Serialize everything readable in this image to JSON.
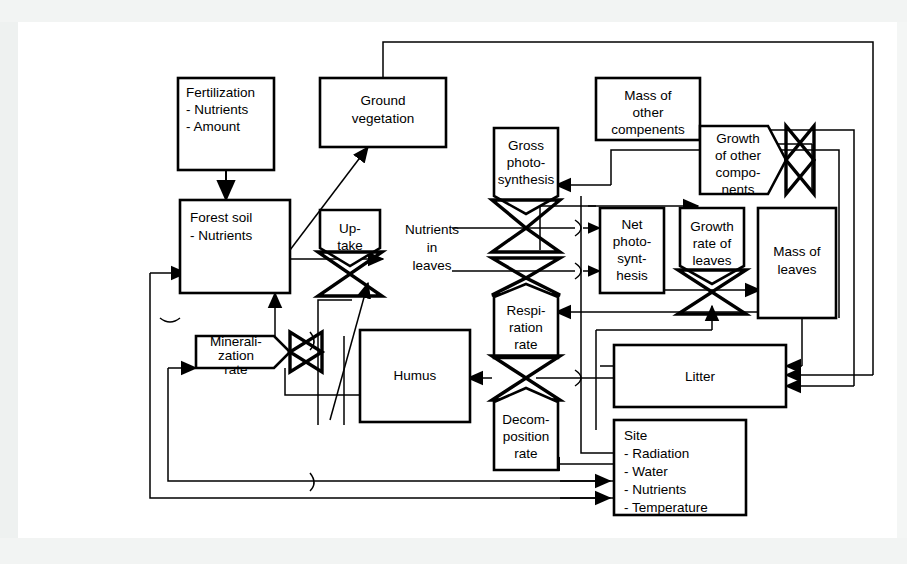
{
  "figure": {
    "kind": "system-dynamics-stock-and-flow-diagram",
    "colors": {
      "ink": "#000000",
      "paper": "#ffffff",
      "scan_edge": "#f2f4f3"
    }
  },
  "nodes": {
    "fertilization": {
      "lines": [
        "Fertilization",
        "- Nutrients",
        "- Amount"
      ],
      "shape": "stock-box",
      "align": "left"
    },
    "ground_vegetation": {
      "lines": [
        "Ground",
        "vegetation"
      ],
      "shape": "stock-box",
      "align": "center"
    },
    "forest_soil": {
      "lines": [
        "Forest soil",
        "- Nutrients"
      ],
      "shape": "stock-box",
      "align": "left"
    },
    "mineralization_rate": {
      "lines": [
        "Minerali-",
        "zation",
        "rate"
      ],
      "shape": "rate-valve-horizontal",
      "align": "center"
    },
    "humus": {
      "lines": [
        "Humus"
      ],
      "shape": "stock-box",
      "align": "center"
    },
    "uptake": {
      "lines": [
        "Up-",
        "take"
      ],
      "shape": "rate-valve-vertical",
      "align": "center"
    },
    "nutrients_in_leaves": {
      "lines": [
        "Nutrients",
        "in",
        "leaves"
      ],
      "shape": "free-label",
      "align": "center"
    },
    "gross_photosynthesis": {
      "lines": [
        "Gross",
        "photo-",
        "synthesis"
      ],
      "shape": "rate-valve-vertical",
      "align": "center"
    },
    "respiration_rate": {
      "lines": [
        "Respi-",
        "ration",
        "rate"
      ],
      "shape": "rate-valve-vertical",
      "align": "center"
    },
    "decomposition_rate": {
      "lines": [
        "Decom-",
        "position",
        "rate"
      ],
      "shape": "rate-valve-vertical",
      "align": "center"
    },
    "net_photosynthesis": {
      "lines": [
        "Net",
        "photo-",
        "synt-",
        "hesis"
      ],
      "shape": "stock-box",
      "align": "center"
    },
    "growth_rate_of_leaves": {
      "lines": [
        "Growth",
        "rate of",
        "leaves"
      ],
      "shape": "rate-valve-vertical",
      "align": "center"
    },
    "mass_of_leaves": {
      "lines": [
        "Mass of",
        "leaves"
      ],
      "shape": "stock-box",
      "align": "center"
    },
    "mass_of_other_compenents": {
      "lines": [
        "Mass of",
        "other",
        "compenents"
      ],
      "shape": "stock-box",
      "align": "center"
    },
    "growth_of_other_components": {
      "lines": [
        "Growth",
        "of other",
        "compo-",
        "nents"
      ],
      "shape": "rate-valve-horizontal",
      "align": "center"
    },
    "litter": {
      "lines": [
        "Litter"
      ],
      "shape": "stock-box",
      "align": "center"
    },
    "site": {
      "lines": [
        "Site",
        "- Radiation",
        "- Water",
        "- Nutrients",
        "- Temperature"
      ],
      "shape": "stock-box",
      "align": "left"
    }
  },
  "edges": [
    {
      "from": "fertilization",
      "to": "forest_soil",
      "type": "flow"
    },
    {
      "from": "forest_soil",
      "to": "ground_vegetation",
      "type": "info"
    },
    {
      "from": "ground_vegetation",
      "to": "litter",
      "type": "info"
    },
    {
      "from": "forest_soil",
      "to": "uptake",
      "type": "flow"
    },
    {
      "from": "uptake",
      "to": "nutrients_in_leaves",
      "type": "flow"
    },
    {
      "from": "mineralization_rate",
      "to": "forest_soil",
      "type": "flow"
    },
    {
      "from": "humus",
      "to": "mineralization_rate",
      "type": "flow"
    },
    {
      "from": "decomposition_rate",
      "to": "humus",
      "type": "flow"
    },
    {
      "from": "litter",
      "to": "decomposition_rate",
      "type": "flow"
    },
    {
      "from": "nutrients_in_leaves",
      "to": "gross_photosynthesis",
      "type": "info"
    },
    {
      "from": "nutrients_in_leaves",
      "to": "net_photosynthesis",
      "type": "flow"
    },
    {
      "from": "gross_photosynthesis",
      "to": "net_photosynthesis",
      "type": "flow"
    },
    {
      "from": "respiration_rate",
      "to": "net_photosynthesis",
      "type": "flow"
    },
    {
      "from": "net_photosynthesis",
      "to": "growth_rate_of_leaves",
      "type": "flow"
    },
    {
      "from": "growth_rate_of_leaves",
      "to": "mass_of_leaves",
      "type": "flow"
    },
    {
      "from": "net_photosynthesis",
      "to": "growth_of_other_components",
      "type": "flow"
    },
    {
      "from": "growth_of_other_components",
      "to": "mass_of_other_compenents",
      "type": "flow"
    },
    {
      "from": "mass_of_leaves",
      "to": "litter",
      "type": "flow"
    },
    {
      "from": "mass_of_other_compenents",
      "to": "litter",
      "type": "flow"
    },
    {
      "from": "mass_of_leaves",
      "to": "gross_photosynthesis",
      "type": "info"
    },
    {
      "from": "mass_of_leaves",
      "to": "respiration_rate",
      "type": "info"
    },
    {
      "from": "site",
      "to": "gross_photosynthesis",
      "type": "info"
    },
    {
      "from": "site",
      "to": "decomposition_rate",
      "type": "info"
    },
    {
      "from": "site",
      "to": "mineralization_rate",
      "type": "info"
    },
    {
      "from": "site",
      "to": "growth_rate_of_leaves",
      "type": "info"
    }
  ]
}
